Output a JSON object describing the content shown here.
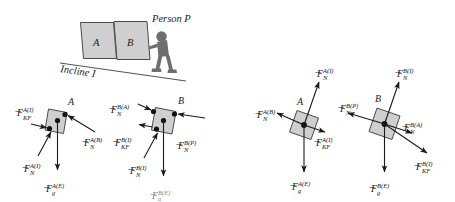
{
  "figure": {
    "title_text": "",
    "colors": {
      "block_fill": "#cfcfcf",
      "block_stroke": "#4a4a4a",
      "incline_stroke": "#555555",
      "person_fill": "#6e6e6e",
      "arrow_stroke": "#1a1a1a",
      "dot_fill": "#111111",
      "background": "#ffffff"
    }
  },
  "scene": {
    "name": "incline-scene",
    "block_a_label": "A",
    "block_b_label": "B",
    "person_label": "Person P",
    "incline_label": "Incline I"
  },
  "fbd_a_tilted": {
    "name": "free-body-diagram-block-a-tilted",
    "body_label": "A",
    "forces": [
      {
        "id": "kf-a-i",
        "symbol": "F",
        "sub": "KF",
        "sup": "A(I)"
      },
      {
        "id": "n-a-b",
        "symbol": "F",
        "sub": "N",
        "sup": "A(B)"
      },
      {
        "id": "n-a-i",
        "symbol": "F",
        "sub": "N",
        "sup": "A(I)"
      },
      {
        "id": "g-a-e",
        "symbol": "F",
        "sub": "g",
        "sup": "A(E)"
      }
    ]
  },
  "fbd_b_tilted": {
    "name": "free-body-diagram-block-b-tilted",
    "body_label": "B",
    "forces": [
      {
        "id": "n-b-a",
        "symbol": "F",
        "sub": "N",
        "sup": "B(A)"
      },
      {
        "id": "n-b-p",
        "symbol": "F",
        "sub": "N",
        "sup": "B(P)"
      },
      {
        "id": "kf-b-i",
        "symbol": "F",
        "sub": "KF",
        "sup": "B(I)"
      },
      {
        "id": "n-b-i",
        "symbol": "F",
        "sub": "N",
        "sup": "B(I)"
      },
      {
        "id": "g-b-e",
        "symbol": "F",
        "sub": "g",
        "sup": "B(E)"
      }
    ]
  },
  "fbd_a_rotated": {
    "name": "free-body-diagram-block-a-rotated",
    "body_label": "A",
    "forces": [
      {
        "id": "n-a-i-r",
        "symbol": "F",
        "sub": "N",
        "sup": "A(I)"
      },
      {
        "id": "n-a-b-r",
        "symbol": "F",
        "sub": "N",
        "sup": "A(B)"
      },
      {
        "id": "kf-a-i-r",
        "symbol": "F",
        "sub": "KF",
        "sup": "A(I)"
      },
      {
        "id": "g-a-e-r",
        "symbol": "F",
        "sub": "g",
        "sup": "A(E)"
      }
    ]
  },
  "fbd_b_rotated": {
    "name": "free-body-diagram-block-b-rotated",
    "body_label": "B",
    "forces": [
      {
        "id": "n-b-i-r",
        "symbol": "F",
        "sub": "N",
        "sup": "B(I)"
      },
      {
        "id": "n-b-p-r",
        "symbol": "F",
        "sub": "N",
        "sup": "B(P)"
      },
      {
        "id": "n-b-a-r",
        "symbol": "F",
        "sub": "N",
        "sup": "B(A)"
      },
      {
        "id": "kf-b-i-r",
        "symbol": "F",
        "sub": "KF",
        "sup": "B(I)"
      },
      {
        "id": "g-b-e-r",
        "symbol": "F",
        "sub": "g",
        "sup": "B(E)"
      }
    ]
  }
}
